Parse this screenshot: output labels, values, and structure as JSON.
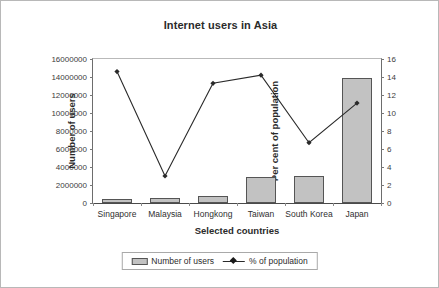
{
  "chart_data": {
    "type": "bar",
    "title": "Internet users in Asia",
    "xlabel": "Selected countries",
    "ylabel": "Number of users",
    "y2label": "Per cent of population",
    "categories": [
      "Singapore",
      "Malaysia",
      "Hongkong",
      "Taiwan",
      "South Korea",
      "Japan"
    ],
    "ylim": [
      0,
      16000000
    ],
    "yticks": [
      "0",
      "2000000",
      "4000000",
      "6000000",
      "8000000",
      "10000000",
      "12000000",
      "14000000",
      "16000000"
    ],
    "ytick_values": [
      0,
      2000000,
      4000000,
      6000000,
      8000000,
      10000000,
      12000000,
      14000000,
      16000000
    ],
    "y2lim": [
      0,
      16
    ],
    "y2ticks": [
      "0",
      "2",
      "4",
      "6",
      "8",
      "10",
      "12",
      "14",
      "16"
    ],
    "y2tick_values": [
      0,
      2,
      4,
      6,
      8,
      10,
      12,
      14,
      16
    ],
    "grid": false,
    "legend_position": "bottom",
    "series": [
      {
        "name": "Number of users",
        "type": "bar",
        "axis": "left",
        "color": "#c2c2c2",
        "border_color": "#555555",
        "values": [
          500000,
          600000,
          800000,
          2900000,
          3000000,
          13900000
        ]
      },
      {
        "name": "% of population",
        "type": "line",
        "axis": "right",
        "color": "#2a2a2a",
        "marker": "diamond",
        "values": [
          14.6,
          3.0,
          13.3,
          14.2,
          6.7,
          11.1
        ]
      }
    ]
  }
}
